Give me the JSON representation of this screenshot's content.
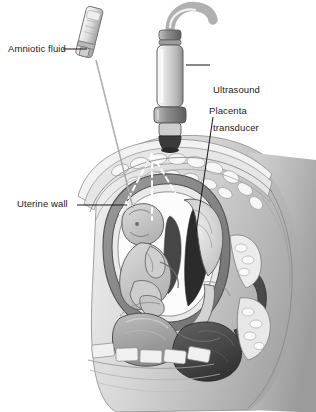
{
  "figure": {
    "type": "medical-illustration",
    "view": "sagittal cross-section of gravid abdomen and pelvis",
    "style": "grayscale line-and-wash anatomical drawing",
    "background_color": "#ffffff"
  },
  "labels": {
    "amniotic_fluid": "Amniotic fluid",
    "ultrasound_line1": "Ultrasound",
    "ultrasound_line2": "transducer",
    "placenta": "Placenta",
    "uterine_wall": "Uterine wall"
  },
  "leader_lines": [
    {
      "name": "amniotic-fluid-leader",
      "from": [
        62,
        50
      ],
      "to": [
        86,
        50
      ]
    },
    {
      "name": "ultrasound-transducer-leader",
      "from": [
        210,
        66
      ],
      "to": [
        186,
        66
      ]
    },
    {
      "name": "placenta-leader",
      "from": [
        213,
        117
      ],
      "to": [
        196,
        232
      ]
    },
    {
      "name": "uterine-wall-leader",
      "from": [
        76,
        205
      ],
      "to": [
        126,
        205
      ]
    },
    {
      "name": "needle-shaft-leader",
      "from": [
        97,
        62
      ],
      "to": [
        133,
        208
      ]
    }
  ],
  "instruments": {
    "syringe": {
      "name": "amniocentesis syringe",
      "barrel_color": "#d8d8d8",
      "needle_color": "#8a8a8a",
      "tip_point": [
        134,
        209
      ]
    },
    "transducer": {
      "name": "ultrasound transducer probe",
      "body_color": "#d4d4d4",
      "band_color": "#8e8e8e",
      "tip_color": "#3a3a3a",
      "cable_color": "#c9c9c9",
      "contact_point": [
        152,
        150
      ]
    },
    "beam": {
      "name": "ultrasound beam",
      "style": "white dashed fan",
      "color": "#ffffff",
      "rays": 3
    }
  },
  "anatomy": {
    "structures": [
      {
        "name": "abdominal-wall",
        "tone": "#e8e8e8"
      },
      {
        "name": "subcutaneous-fat",
        "tone": "#efefef"
      },
      {
        "name": "uterine-wall",
        "tone": "#7d7d7d"
      },
      {
        "name": "amniotic-cavity",
        "tone": "#2e2e2e"
      },
      {
        "name": "fetus",
        "tone": "#c4c4c4"
      },
      {
        "name": "placenta",
        "tone": "#d9d9d9"
      },
      {
        "name": "urinary-bladder",
        "tone": "#9a9a9a"
      },
      {
        "name": "rectum",
        "tone": "#4a4a4a"
      },
      {
        "name": "vertebral-column",
        "tone": "#ededed"
      },
      {
        "name": "pubic-bone",
        "tone": "#e4e4e4"
      },
      {
        "name": "maternal-back-contour",
        "tone": "#b7b7b7"
      },
      {
        "name": "thigh-contour",
        "tone": "#b0b0b0"
      }
    ]
  },
  "palette": {
    "ink": "#1b1b1b",
    "outline": "#555555",
    "dark_fluid": "#2e2e2e",
    "mid_gray": "#9a9a9a",
    "light_gray": "#d9d9d9",
    "pale": "#efefef",
    "white": "#ffffff"
  }
}
